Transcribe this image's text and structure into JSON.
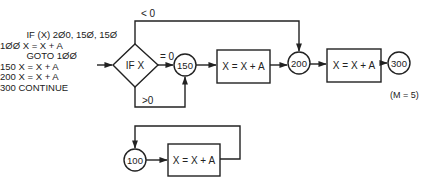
{
  "code": {
    "lines": [
      "          IF (X) 2Ø0, 15Ø, 15Ø",
      "1ØØ X = X + A",
      "          GOTO 1ØØ",
      "150 X = X + A",
      "200 X = X + A",
      "300 CONTINUE"
    ]
  },
  "flowchart": {
    "decision": {
      "label": "IF X"
    },
    "branches": {
      "less": "< 0",
      "equal": "= 0",
      "greater": ">0"
    },
    "nodes": {
      "n150": "150",
      "n200": "200",
      "n300": "300",
      "n100": "100"
    },
    "boxes": {
      "box1": "X = X + A",
      "box2": "X = X + A",
      "box3": "X = X + A"
    },
    "note": "(M = 5)"
  },
  "colors": {
    "stroke": "#222222",
    "background": "#ffffff"
  }
}
